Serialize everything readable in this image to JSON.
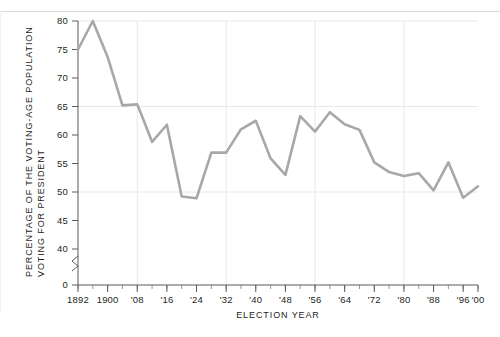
{
  "chart_data": {
    "type": "line",
    "title": "",
    "xlabel": "ELECTION  YEAR",
    "ylabel_line1": "PERCENTAGE OF THE VOTING-AGE POPULATION",
    "ylabel_line2": "VOTING FOR PRESIDENT",
    "ylim": [
      40,
      80
    ],
    "y_zero_label": "0",
    "y_axis_break": true,
    "grid": "both",
    "legend": "none",
    "line_color": "#a8a8a8",
    "ytick_labels": [
      "80",
      "75",
      "70",
      "65",
      "60",
      "55",
      "50",
      "45",
      "40",
      "0"
    ],
    "ytick_values": [
      80,
      75,
      70,
      65,
      60,
      55,
      50,
      45,
      40
    ],
    "xtick_labels": [
      "1892",
      "1900",
      "'08",
      "'16",
      "'24",
      "'32",
      "'40",
      "'48",
      "'56",
      "'64",
      "'72",
      "'80",
      "'88",
      "'96",
      "'00"
    ],
    "xtick_years": [
      1892,
      1900,
      1908,
      1916,
      1924,
      1932,
      1940,
      1948,
      1956,
      1964,
      1972,
      1980,
      1988,
      1996,
      2000
    ],
    "x": [
      1892,
      1896,
      1900,
      1904,
      1908,
      1912,
      1916,
      1920,
      1924,
      1928,
      1932,
      1936,
      1940,
      1944,
      1948,
      1952,
      1956,
      1960,
      1964,
      1968,
      1972,
      1976,
      1980,
      1984,
      1988,
      1992,
      1996,
      2000
    ],
    "values": [
      75.0,
      80.0,
      73.7,
      65.2,
      65.4,
      58.8,
      61.8,
      49.2,
      48.9,
      56.9,
      56.9,
      61.0,
      62.5,
      55.9,
      53.0,
      63.3,
      60.6,
      64.0,
      61.9,
      60.9,
      55.2,
      53.5,
      52.8,
      53.3,
      50.3,
      55.2,
      49.0,
      51.0
    ],
    "annotations": []
  }
}
